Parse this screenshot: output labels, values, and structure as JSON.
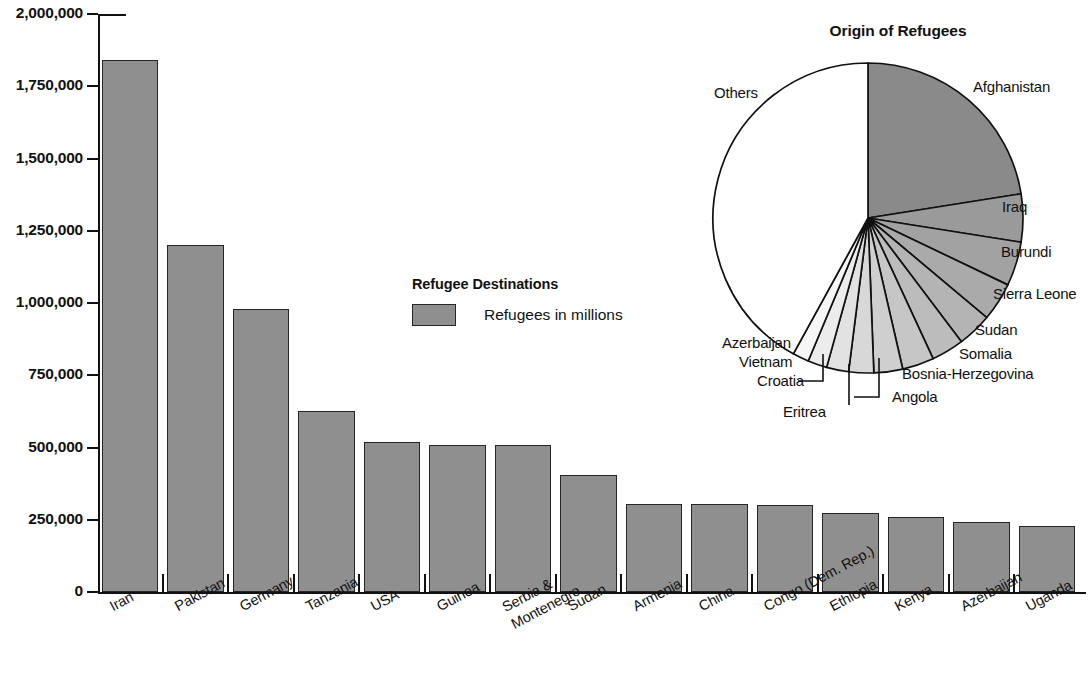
{
  "bar_panel": {
    "legend": {
      "title": "Refugee Destinations",
      "series_label": "Refugees in millions",
      "swatch_color": "#8f8f8f"
    }
  },
  "pie_panel": {
    "title": "Origin of Refugees"
  },
  "chart_data": [
    {
      "type": "bar",
      "title": "Refugee Destinations",
      "xlabel": "",
      "ylabel": "",
      "ylim": [
        0,
        2000000
      ],
      "grid": false,
      "legend": [
        "Refugees in millions"
      ],
      "legend_position": "center",
      "ytick_labels": [
        "0",
        "250,000",
        "500,000",
        "750,000",
        "1,000,000",
        "1,250,000",
        "1,500,000",
        "1,750,000",
        "2,000,000"
      ],
      "ytick_values": [
        0,
        250000,
        500000,
        750000,
        1000000,
        1250000,
        1500000,
        1750000,
        2000000
      ],
      "categories": [
        "Iran",
        "Pakistan",
        "Germany",
        "Tanzania",
        "USA",
        "Guinea",
        "Serbia &\nMontenegro",
        "Sudan",
        "Armenia",
        "China",
        "Congo (Dem. Rep.)",
        "Ethiopia",
        "Kenya",
        "Azerbaijan",
        "Uganda"
      ],
      "values": [
        1840000,
        1200000,
        980000,
        625000,
        520000,
        510000,
        510000,
        405000,
        305000,
        305000,
        300000,
        275000,
        258000,
        243000,
        228000
      ],
      "bar_color": "#8f8f8f"
    },
    {
      "type": "pie",
      "title": "Origin of Refugees",
      "labels": [
        "Afghanistan",
        "Iraq",
        "Burundi",
        "Sierra Leone",
        "Sudan",
        "Somalia",
        "Bosnia-Herzegovina",
        "Angola",
        "Eritrea",
        "Croatia",
        "Vietnam",
        "Azerbaijan",
        "Others"
      ],
      "values": [
        22.5,
        5.0,
        4.6,
        4.0,
        3.6,
        3.4,
        3.3,
        3.0,
        2.6,
        2.3,
        2.0,
        1.7,
        42.0
      ],
      "slice_colors": [
        "#8a8a8a",
        "#9a9a9a",
        "#a2a2a2",
        "#aaaaaa",
        "#b4b4b4",
        "#bcbcbc",
        "#c6c6c6",
        "#cfcfcf",
        "#d8d8d8",
        "#e2e2e2",
        "#ececec",
        "#f6f6f6",
        "#ffffff"
      ],
      "start_angle_deg": 0,
      "direction": "clockwise"
    }
  ]
}
